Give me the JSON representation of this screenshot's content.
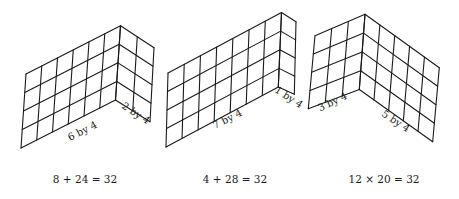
{
  "figures": [
    {
      "id": "figure-1",
      "left_panel": {
        "columns": 6,
        "rows": 4,
        "label": "6 by 4"
      },
      "right_panel": {
        "columns": 2,
        "rows": 4,
        "label": "2 by 4"
      },
      "caption": "8 + 24 = 32"
    },
    {
      "id": "figure-2",
      "left_panel": {
        "columns": 7,
        "rows": 4,
        "label": "7 by 4"
      },
      "right_panel": {
        "columns": 1,
        "rows": 4,
        "label": "1 by 4"
      },
      "caption": "4 + 28 = 32"
    },
    {
      "id": "figure-3",
      "left_panel": {
        "columns": 3,
        "rows": 4,
        "label": "3 by 4"
      },
      "right_panel": {
        "columns": 5,
        "rows": 4,
        "label": "5 by 4"
      },
      "caption": "12 × 20 = 32"
    }
  ],
  "colors": {
    "ink": "#1a1a1a",
    "background": "#ffffff"
  }
}
